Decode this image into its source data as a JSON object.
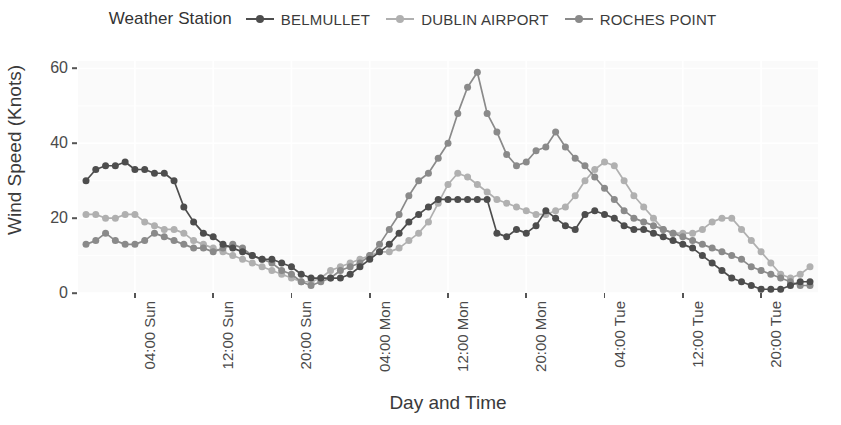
{
  "legend": {
    "title": "Weather Station",
    "position": "top",
    "entries": [
      {
        "label": "BELMULLET",
        "color": "#4d4d4d"
      },
      {
        "label": "DUBLIN AIRPORT",
        "color": "#b0b0b0"
      },
      {
        "label": "ROCHES POINT",
        "color": "#8a8a8a"
      }
    ]
  },
  "axes": {
    "xlabel": "Day and Time",
    "ylabel": "Wind Speed (Knots)",
    "yticks": [
      "0",
      "20",
      "40",
      "60"
    ],
    "xticks": [
      "04:00 Sun",
      "12:00 Sun",
      "20:00 Sun",
      "04:00 Mon",
      "12:00 Mon",
      "20:00 Mon",
      "04:00 Tue",
      "12:00 Tue",
      "20:00 Tue"
    ]
  },
  "chart_data": {
    "type": "line",
    "title": "",
    "subtitle": "",
    "xlabel": "Day and Time",
    "ylabel": "Wind Speed (Knots)",
    "legend_title": "Weather Station",
    "legend_position": "top",
    "grid": true,
    "markers": true,
    "ylim": [
      0,
      62
    ],
    "yticks": [
      0,
      20,
      40,
      60
    ],
    "xtick_labels": [
      "04:00 Sun",
      "12:00 Sun",
      "20:00 Sun",
      "04:00 Mon",
      "12:00 Mon",
      "20:00 Mon",
      "04:00 Tue",
      "12:00 Tue",
      "20:00 Tue"
    ],
    "xtick_indices": [
      5,
      13,
      21,
      29,
      37,
      45,
      53,
      61,
      69
    ],
    "x_index_range": [
      0,
      74
    ],
    "series": [
      {
        "name": "BELMULLET",
        "color": "#4d4d4d",
        "values": [
          30,
          33,
          34,
          34,
          35,
          33,
          33,
          32,
          32,
          30,
          23,
          19,
          16,
          15,
          13,
          12,
          11,
          10,
          9,
          9,
          8,
          7,
          5,
          4,
          4,
          4,
          4,
          5,
          7,
          9,
          11,
          13,
          16,
          19,
          21,
          23,
          25,
          25,
          25,
          25,
          25,
          25,
          16,
          15,
          17,
          16,
          18,
          22,
          20,
          18,
          17,
          21,
          22,
          21,
          20,
          18,
          17,
          17,
          16,
          15,
          14,
          13,
          12,
          10,
          8,
          6,
          4,
          3,
          2,
          1,
          1,
          1,
          2,
          3,
          3
        ]
      },
      {
        "name": "DUBLIN AIRPORT",
        "color": "#b0b0b0",
        "values": [
          21,
          21,
          20,
          20,
          21,
          21,
          19,
          18,
          17,
          17,
          16,
          14,
          13,
          12,
          11,
          10,
          9,
          8,
          7,
          6,
          5,
          4,
          3,
          3,
          4,
          6,
          7,
          8,
          9,
          10,
          11,
          11,
          12,
          14,
          16,
          19,
          24,
          29,
          32,
          31,
          29,
          27,
          25,
          24,
          23,
          22,
          21,
          21,
          22,
          23,
          26,
          30,
          33,
          35,
          34,
          30,
          26,
          23,
          20,
          17,
          16,
          16,
          16,
          17,
          19,
          20,
          20,
          17,
          14,
          11,
          8,
          5,
          4,
          5,
          7
        ]
      },
      {
        "name": "ROCHES POINT",
        "color": "#8a8a8a",
        "values": [
          13,
          14,
          16,
          14,
          13,
          13,
          14,
          16,
          15,
          14,
          13,
          12,
          12,
          11,
          12,
          13,
          12,
          10,
          9,
          8,
          6,
          5,
          3,
          2,
          3,
          4,
          6,
          7,
          8,
          10,
          13,
          17,
          21,
          26,
          30,
          32,
          36,
          40,
          48,
          55,
          59,
          48,
          43,
          37,
          34,
          35,
          38,
          39,
          43,
          39,
          36,
          34,
          31,
          28,
          25,
          22,
          20,
          19,
          18,
          17,
          16,
          15,
          14,
          13,
          12,
          11,
          10,
          9,
          7,
          6,
          5,
          4,
          3,
          2,
          2
        ]
      }
    ]
  }
}
